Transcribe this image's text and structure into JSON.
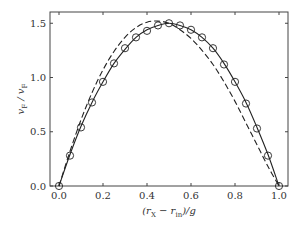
{
  "chart_data": {
    "type": "line",
    "title": "",
    "xlabel": "(r_X − r_in)/g",
    "ylabel": "v_F / v_F",
    "xlim": [
      -0.03,
      1.04
    ],
    "ylim": [
      0,
      1.6
    ],
    "x_ticks": [
      0.0,
      0.2,
      0.4,
      0.6,
      0.8,
      1.0
    ],
    "x_tick_labels": [
      "0.0",
      "0.2",
      "0.4",
      "0.6",
      "0.8",
      "1.0"
    ],
    "y_ticks": [
      0.0,
      0.5,
      1.0,
      1.5
    ],
    "y_tick_labels": [
      "0.0",
      "0.5",
      "1.0",
      "1.5"
    ],
    "grid": false,
    "legend": null,
    "series": [
      {
        "name": "solid-curve",
        "style": "solid",
        "color": "#222222",
        "x": [
          0.0,
          0.05,
          0.1,
          0.15,
          0.2,
          0.25,
          0.3,
          0.35,
          0.4,
          0.45,
          0.5,
          0.55,
          0.6,
          0.65,
          0.7,
          0.75,
          0.8,
          0.85,
          0.9,
          0.95,
          1.0
        ],
        "values": [
          0.0,
          0.29,
          0.55,
          0.77,
          0.96,
          1.13,
          1.26,
          1.37,
          1.44,
          1.48,
          1.5,
          1.48,
          1.44,
          1.37,
          1.27,
          1.13,
          0.96,
          0.77,
          0.54,
          0.29,
          0.0
        ]
      },
      {
        "name": "dashed-curve",
        "style": "dashed",
        "color": "#222222",
        "x": [
          0.0,
          0.05,
          0.1,
          0.15,
          0.2,
          0.25,
          0.3,
          0.35,
          0.4,
          0.45,
          0.5,
          0.55,
          0.6,
          0.65,
          0.7,
          0.75,
          0.8,
          0.85,
          0.9,
          0.95,
          1.0
        ],
        "values": [
          0.0,
          0.32,
          0.61,
          0.86,
          1.07,
          1.24,
          1.37,
          1.46,
          1.51,
          1.52,
          1.5,
          1.44,
          1.36,
          1.25,
          1.12,
          0.96,
          0.78,
          0.58,
          0.38,
          0.18,
          0.0
        ]
      },
      {
        "name": "circle-markers",
        "style": "markers",
        "marker": "open-circle",
        "color": "#222222",
        "x": [
          0.0,
          0.05,
          0.1,
          0.15,
          0.2,
          0.25,
          0.3,
          0.35,
          0.4,
          0.45,
          0.5,
          0.55,
          0.6,
          0.65,
          0.7,
          0.75,
          0.8,
          0.85,
          0.9,
          0.95,
          1.0
        ],
        "values": [
          0.0,
          0.28,
          0.54,
          0.77,
          0.96,
          1.13,
          1.27,
          1.37,
          1.43,
          1.48,
          1.5,
          1.48,
          1.44,
          1.37,
          1.27,
          1.12,
          0.96,
          0.76,
          0.53,
          0.28,
          0.0
        ]
      }
    ]
  },
  "layout": {
    "plot_left": 50,
    "plot_top": 12,
    "plot_right": 288,
    "plot_bottom": 186,
    "x0_px": 59,
    "x1_px": 279,
    "y0_px": 186,
    "y_px_per_unit": 108.5
  }
}
